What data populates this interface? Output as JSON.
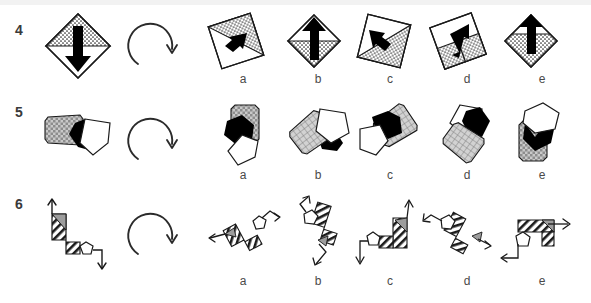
{
  "page": {
    "background_color": "#ffffff",
    "top_band_color": "#f2f2f2",
    "ink_color": "#1a1a1a",
    "gray_fill_color": "#b3b3b3",
    "black_fill_color": "#000000",
    "white_fill_color": "#ffffff"
  },
  "rows": [
    {
      "number": "4",
      "prompt_name": "diamond-with-down-arrow",
      "rotation_icon": "clockwise-rotation-arrow",
      "options": [
        {
          "letter": "a",
          "name": "tilted-square-stippled-triangle-arrow-up-right"
        },
        {
          "letter": "b",
          "name": "diamond-stippled-bottom-arrow-up"
        },
        {
          "letter": "c",
          "name": "tilted-square-stippled-arrow-up-left"
        },
        {
          "letter": "d",
          "name": "tilted-square-stippled-left-arrow-up-right"
        },
        {
          "letter": "e",
          "name": "diamond-stippled-bottom-arrow-up-alt"
        }
      ]
    },
    {
      "number": "5",
      "prompt_name": "gray-block-black-chevron-white-pentagon",
      "rotation_icon": "clockwise-rotation-arrow",
      "options": [
        {
          "letter": "a",
          "name": "gray-block-top-black-hex-white-pentagon-bottom"
        },
        {
          "letter": "b",
          "name": "gray-block-left-white-pentagon-right-black-chevron"
        },
        {
          "letter": "c",
          "name": "black-chevron-top-gray-block-right-white-pentagon-left"
        },
        {
          "letter": "d",
          "name": "white-pentagon-top-black-chevron-gray-block-bottom"
        },
        {
          "letter": "e",
          "name": "gray-block-bottom-black-chevron-white-pentagon-top"
        }
      ]
    },
    {
      "number": "6",
      "prompt_name": "hatched-staircase-up-arrow-pentagon-down-arrow",
      "rotation_icon": "clockwise-rotation-arrow",
      "options": [
        {
          "letter": "a",
          "name": "hatched-zigzag-horizontal-left-arrow-pentagon-right"
        },
        {
          "letter": "b",
          "name": "hatched-zigzag-vertical-pentagon-top-arrow-down"
        },
        {
          "letter": "c",
          "name": "hatched-staircase-pentagon-left-arrow-up"
        },
        {
          "letter": "d",
          "name": "hatched-zigzag-pentagon-left-arrow-down-right"
        },
        {
          "letter": "e",
          "name": "hatched-staircase-pentagon-bottom-arrow-right"
        }
      ]
    }
  ],
  "layout": {
    "option_letter_x": [
      228,
      303,
      375,
      452,
      527
    ],
    "option_figure_x": [
      205,
      282,
      352,
      425,
      500
    ]
  }
}
